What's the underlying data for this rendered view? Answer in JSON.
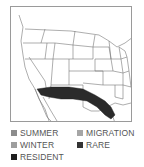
{
  "map": {
    "title": "Range map",
    "region": "Southwestern United States and northern Mexico",
    "range_color": "#2b2b2b",
    "border_color": "#9a9a9a"
  },
  "legend": {
    "items": [
      {
        "label": "SUMMER",
        "color": "#8c8c8c"
      },
      {
        "label": "MIGRATION",
        "color": "#a6a6a6"
      },
      {
        "label": "WINTER",
        "color": "#9e9e9e"
      },
      {
        "label": "RARE",
        "color": "#333333"
      },
      {
        "label": "RESIDENT",
        "color": "#1e1e1e"
      }
    ]
  }
}
